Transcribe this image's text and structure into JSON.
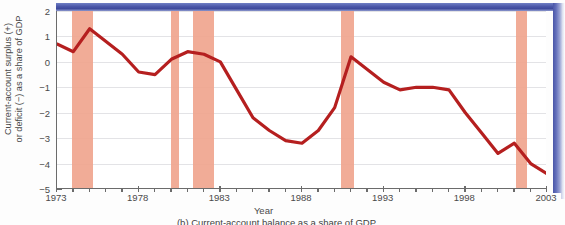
{
  "figure": {
    "caption": "(b) Current-account balance as a share of GDP",
    "x_axis_title": "Year",
    "y_axis_title_line1": "Current-account surplus (+)",
    "y_axis_title_line2": "or deficit (−) as a share of GDP"
  },
  "colors": {
    "line": "#b51f1f",
    "recession_band": "#f0a58e",
    "grid": "#e3e3e6",
    "axis": "#6b6b6b",
    "page_edge_blue": "#4a56a8",
    "plot_background": "#ffffff"
  },
  "chart_data": {
    "type": "line",
    "title": "",
    "subtitle": "",
    "xlabel": "Year",
    "ylabel": "Current-account surplus (+) or deficit (−) as a share of GDP",
    "xlim": [
      1973,
      2003
    ],
    "ylim": [
      -5,
      2
    ],
    "grid": true,
    "legend": null,
    "x_ticks": [
      1973,
      1978,
      1983,
      1988,
      1993,
      1998,
      2003
    ],
    "x_tick_labels": [
      "1973",
      "1978",
      "1983",
      "1988",
      "1993",
      "1998",
      "2003"
    ],
    "x_minor_tick_step": 1,
    "y_ticks": [
      2,
      1,
      0,
      -1,
      -2,
      -3,
      -4,
      -5
    ],
    "y_tick_labels": [
      "2",
      "1",
      "0",
      "−1",
      "−2",
      "−3",
      "−4",
      "−5"
    ],
    "series": [
      {
        "name": "Current-account balance (% of GDP)",
        "color": "#b51f1f",
        "x": [
          1973,
          1974,
          1975,
          1976,
          1977,
          1978,
          1979,
          1980,
          1981,
          1982,
          1983,
          1984,
          1985,
          1986,
          1987,
          1988,
          1989,
          1990,
          1991,
          1992,
          1993,
          1994,
          1995,
          1996,
          1997,
          1998,
          1999,
          2000,
          2001,
          2002,
          2003
        ],
        "y": [
          0.7,
          0.4,
          1.3,
          0.8,
          0.3,
          -0.4,
          -0.5,
          0.1,
          0.4,
          0.3,
          0.0,
          -1.1,
          -2.2,
          -2.7,
          -3.1,
          -3.2,
          -2.7,
          -1.8,
          0.2,
          -0.3,
          -0.8,
          -1.1,
          -1.0,
          -1.0,
          -1.1,
          -2.0,
          -2.8,
          -3.6,
          -3.2,
          -4.0,
          -4.4
        ]
      }
    ],
    "annotations": {
      "recession_bands": [
        {
          "label": "1973–75 recession",
          "start": 1973.9,
          "end": 1975.2
        },
        {
          "label": "1980 recession",
          "start": 1980.0,
          "end": 1980.5
        },
        {
          "label": "1981–82 recession",
          "start": 1981.3,
          "end": 1982.6
        },
        {
          "label": "1990–91 recession",
          "start": 1990.4,
          "end": 1991.2
        },
        {
          "label": "2001 recession",
          "start": 2001.1,
          "end": 2001.8
        }
      ]
    }
  }
}
